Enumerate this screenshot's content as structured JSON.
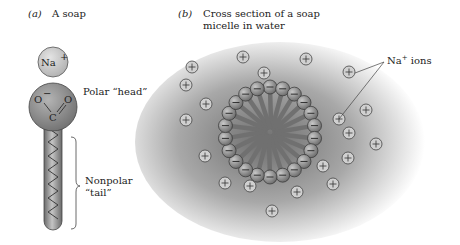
{
  "panel_a": {
    "tag": "(a)",
    "title": "A soap",
    "counter_ion": "Na",
    "counter_ion_charge": "+",
    "head_atoms": [
      "O",
      "O",
      "C"
    ],
    "head_charge": "−",
    "head_label": "Polar “head”",
    "tail_label_line1": "Nonpolar",
    "tail_label_line2": "“tail”"
  },
  "panel_b": {
    "tag": "(b)",
    "title_line1": "Cross section of a soap",
    "title_line2": "micelle in water",
    "ion_label": "Na",
    "ion_label_charge": "+",
    "ion_label_suffix": " ions",
    "ion_symbol": "+",
    "head_symbol": "−",
    "micelle_head_count": 22,
    "ion_count": 20
  },
  "colors": {
    "head_fill": "#8a8a8a",
    "ion_fill": "#d8d8d8",
    "water_shade": "#7a7a7a",
    "stroke": "#333333"
  }
}
